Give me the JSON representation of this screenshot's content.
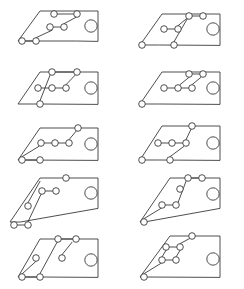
{
  "sheet": {
    "title": "Graph Drawing Panel Grid",
    "width": 244,
    "height": 289,
    "background": "#ffffff",
    "stroke_color": "#3a3a3a",
    "columns": 2,
    "rows": 5,
    "panel_count": 10,
    "node_radius_small": 3.3,
    "node_radius_large": 6.2,
    "stroke_width": 0.9
  },
  "panels": [
    {
      "id": "panel-1",
      "label": "row1-col1",
      "origin": {
        "x": 0,
        "y": 0
      },
      "frame": "M 76,41 L 18,41 L 40,11 L 98,11 L 98,41 Z",
      "anchor_frame_note": "trapezoid with slanted left edge and vertical right edge",
      "big_circle": {
        "cx": 91,
        "cy": 26,
        "r": 6.2
      },
      "nodes": [
        {
          "cx": 22,
          "cy": 41,
          "r": 3.3
        },
        {
          "cx": 36,
          "cy": 41,
          "r": 3.3
        },
        {
          "cx": 54,
          "cy": 14,
          "r": 3.3
        },
        {
          "cx": 77,
          "cy": 14,
          "r": 3.3
        },
        {
          "cx": 50,
          "cy": 27,
          "r": 3.3
        },
        {
          "cx": 64,
          "cy": 27,
          "r": 3.3
        }
      ],
      "edges": [
        "M 25.3,41 L 32.7,41",
        "M 57.3,14 L 73.7,14",
        "M 53.3,27 L 60.7,27",
        "M 36,37.7 L 52,30.3",
        "M 64,23.7 L 76,17.3"
      ]
    },
    {
      "id": "panel-2",
      "label": "row1-col2",
      "origin": {
        "x": 122,
        "y": 0
      },
      "frame": "M 37,45 L 18,45 L 40,14 L 98,14 L 98,45 Z",
      "big_circle": {
        "cx": 91,
        "cy": 29,
        "r": 6.2
      },
      "nodes": [
        {
          "cx": 20,
          "cy": 45,
          "r": 3.3
        },
        {
          "cx": 52,
          "cy": 45,
          "r": 3.3
        },
        {
          "cx": 42,
          "cy": 29,
          "r": 3.3
        },
        {
          "cx": 56,
          "cy": 29,
          "r": 3.3
        },
        {
          "cx": 67,
          "cy": 16,
          "r": 3.3
        },
        {
          "cx": 81,
          "cy": 16,
          "r": 3.3
        }
      ],
      "edges": [
        "M 45.3,29 L 52.7,29",
        "M 70.3,16 L 77.7,16",
        "M 52,41.7 L 65,19.3",
        "M 56,25.7 L 65,18.3"
      ]
    },
    {
      "id": "panel-3",
      "label": "row2-col1",
      "origin": {
        "x": 0,
        "y": 58
      },
      "frame": "M 40,46 L 18,46 L 40,14 L 98,14 L 98,46 Z",
      "big_circle": {
        "cx": 91,
        "cy": 30,
        "r": 6.2
      },
      "nodes": [
        {
          "cx": 40,
          "cy": 46,
          "r": 3.3
        },
        {
          "cx": 52,
          "cy": 14,
          "r": 3.3
        },
        {
          "cx": 77,
          "cy": 14,
          "r": 3.3
        },
        {
          "cx": 38,
          "cy": 30,
          "r": 3.3
        },
        {
          "cx": 52,
          "cy": 30,
          "r": 3.3
        },
        {
          "cx": 66,
          "cy": 30,
          "r": 3.3
        }
      ],
      "edges": [
        "M 55.3,14 L 73.7,14",
        "M 41.3,30 L 48.7,30",
        "M 55.3,30 L 62.7,30",
        "M 40,42.7 L 50,17.3",
        "M 66,26.7 L 75,17.3"
      ]
    },
    {
      "id": "panel-4",
      "label": "row2-col2",
      "origin": {
        "x": 122,
        "y": 58
      },
      "frame": "M 37,46 L 18,46 L 40,14 L 98,14 L 98,46 Z",
      "big_circle": {
        "cx": 91,
        "cy": 30,
        "r": 6.2
      },
      "nodes": [
        {
          "cx": 20,
          "cy": 46,
          "r": 3.3
        },
        {
          "cx": 42,
          "cy": 30,
          "r": 3.3
        },
        {
          "cx": 56,
          "cy": 30,
          "r": 3.3
        },
        {
          "cx": 70,
          "cy": 30,
          "r": 3.3
        },
        {
          "cx": 67,
          "cy": 16,
          "r": 3.3
        },
        {
          "cx": 81,
          "cy": 16,
          "r": 3.3
        }
      ],
      "edges": [
        "M 45.3,30 L 52.7,30",
        "M 59.3,30 L 66.7,30",
        "M 70.3,16 L 77.7,16",
        "M 70,26.7 L 79,19.3",
        "M 67,19.3 L 58,26.7"
      ]
    },
    {
      "id": "panel-5",
      "label": "row3-col1",
      "origin": {
        "x": 0,
        "y": 116
      },
      "frame": "M 22,44 L 18,44 L 40,12 L 98,12 L 98,44 Z",
      "big_circle": {
        "cx": 91,
        "cy": 28,
        "r": 6.2
      },
      "nodes": [
        {
          "cx": 22,
          "cy": 44,
          "r": 3.3
        },
        {
          "cx": 40,
          "cy": 44,
          "r": 3.3
        },
        {
          "cx": 41,
          "cy": 27,
          "r": 3.3
        },
        {
          "cx": 55,
          "cy": 27,
          "r": 3.3
        },
        {
          "cx": 69,
          "cy": 27,
          "r": 3.3
        },
        {
          "cx": 78,
          "cy": 12,
          "r": 3.3
        }
      ],
      "edges": [
        "M 25.3,44 L 36.7,44",
        "M 44.3,27 L 51.7,27",
        "M 58.3,27 L 65.7,27",
        "M 22,40.7 L 39,30.3",
        "M 69,23.7 L 76,15.3"
      ]
    },
    {
      "id": "panel-6",
      "label": "row3-col2",
      "origin": {
        "x": 122,
        "y": 116
      },
      "frame": "M 37,44 L 18,44 L 40,10 L 98,10 L 98,44 Z",
      "big_circle": {
        "cx": 91,
        "cy": 27,
        "r": 6.2
      },
      "nodes": [
        {
          "cx": 20,
          "cy": 44,
          "r": 3.3
        },
        {
          "cx": 48,
          "cy": 44,
          "r": 3.3
        },
        {
          "cx": 36,
          "cy": 27,
          "r": 3.3
        },
        {
          "cx": 50,
          "cy": 27,
          "r": 3.3
        },
        {
          "cx": 64,
          "cy": 27,
          "r": 3.3
        },
        {
          "cx": 70,
          "cy": 10,
          "r": 3.3
        }
      ],
      "edges": [
        "M 39.3,27 L 46.7,27",
        "M 53.3,27 L 60.7,27",
        "M 48,40.7 L 62,30.3",
        "M 64,23.7 L 69,13.3"
      ]
    },
    {
      "id": "panel-7",
      "label": "row4-col1",
      "origin": {
        "x": 0,
        "y": 172
      },
      "frame": "M 20,50 L 10,50 L 40,6 L 98,6 L 98,36 Z",
      "big_circle": {
        "cx": 91,
        "cy": 21,
        "r": 6.2
      },
      "nodes": [
        {
          "cx": 14,
          "cy": 53,
          "r": 3.3
        },
        {
          "cx": 28,
          "cy": 53,
          "r": 3.3
        },
        {
          "cx": 28,
          "cy": 34,
          "r": 3.3
        },
        {
          "cx": 42,
          "cy": 19,
          "r": 3.3
        },
        {
          "cx": 56,
          "cy": 19,
          "r": 3.3
        },
        {
          "cx": 66,
          "cy": 6,
          "r": 3.3
        }
      ],
      "edges": [
        "M 17.3,53 L 24.7,53",
        "M 45.3,19 L 52.7,19",
        "M 28,49.7 L 41,22.3",
        "M 28,30.7 L 40,9.3"
      ]
    },
    {
      "id": "panel-8",
      "label": "row4-col2",
      "origin": {
        "x": 122,
        "y": 172
      },
      "frame": "M 22,50 L 18,50 L 48,6 L 98,6 L 98,36 Z",
      "big_circle": {
        "cx": 91,
        "cy": 22,
        "r": 6.2
      },
      "nodes": [
        {
          "cx": 22,
          "cy": 50,
          "r": 3.3
        },
        {
          "cx": 40,
          "cy": 33,
          "r": 3.3
        },
        {
          "cx": 54,
          "cy": 33,
          "r": 3.3
        },
        {
          "cx": 58,
          "cy": 17,
          "r": 3.3
        },
        {
          "cx": 66,
          "cy": 6,
          "r": 3.3
        },
        {
          "cx": 80,
          "cy": 6,
          "r": 3.3
        }
      ],
      "edges": [
        "M 43.3,33 L 50.7,33",
        "M 69.3,6 L 76.7,6",
        "M 22,46.7 L 39,36.3",
        "M 56,30.7 L 64,9.3"
      ]
    },
    {
      "id": "panel-9",
      "label": "row5-col1",
      "origin": {
        "x": 0,
        "y": 230
      },
      "frame": "M 40,47 L 18,47 L 40,9 L 98,9 L 98,47 Z",
      "big_circle": {
        "cx": 91,
        "cy": 30,
        "r": 6.2
      },
      "nodes": [
        {
          "cx": 22,
          "cy": 47,
          "r": 3.3
        },
        {
          "cx": 40,
          "cy": 47,
          "r": 3.3
        },
        {
          "cx": 36,
          "cy": 28,
          "r": 3.3
        },
        {
          "cx": 62,
          "cy": 28,
          "r": 3.3
        },
        {
          "cx": 58,
          "cy": 9,
          "r": 3.3
        },
        {
          "cx": 76,
          "cy": 9,
          "r": 3.3
        }
      ],
      "edges": [
        "M 25.3,47 L 36.7,47",
        "M 61.3,9 L 72.7,9",
        "M 36,31.3 L 22,44",
        "M 40,43.7 L 57,12.3",
        "M 62,24.7 L 72,12.3"
      ]
    },
    {
      "id": "panel-10",
      "label": "row5-col2",
      "origin": {
        "x": 122,
        "y": 230
      },
      "frame": "M 22,47 L 18,47 L 48,6 L 98,6 L 98,47 Z",
      "big_circle": {
        "cx": 91,
        "cy": 29,
        "r": 6.2
      },
      "nodes": [
        {
          "cx": 22,
          "cy": 47,
          "r": 3.3
        },
        {
          "cx": 40,
          "cy": 30,
          "r": 3.3
        },
        {
          "cx": 54,
          "cy": 30,
          "r": 3.3
        },
        {
          "cx": 44,
          "cy": 17,
          "r": 3.3
        },
        {
          "cx": 58,
          "cy": 17,
          "r": 3.3
        },
        {
          "cx": 70,
          "cy": 6,
          "r": 3.3
        }
      ],
      "edges": [
        "M 43.3,30 L 50.7,30",
        "M 47.3,17 L 54.7,17",
        "M 22,43.7 L 39,33.3",
        "M 44,20.3 L 40,27",
        "M 58,20.3 L 54,27",
        "M 58,13.7 L 68,8.3"
      ]
    }
  ]
}
